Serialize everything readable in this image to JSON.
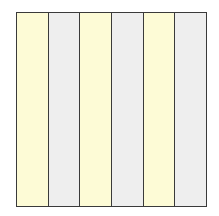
{
  "diagram": {
    "shape": "square",
    "stripe_count": 6,
    "orientation": "vertical",
    "stripes": [
      {
        "color": "#fdfbd6"
      },
      {
        "color": "#eeeeee"
      },
      {
        "color": "#fdfbd6"
      },
      {
        "color": "#eeeeee"
      },
      {
        "color": "#fdfbd6"
      },
      {
        "color": "#eeeeee"
      }
    ],
    "border_color": "#3a3a3a"
  }
}
